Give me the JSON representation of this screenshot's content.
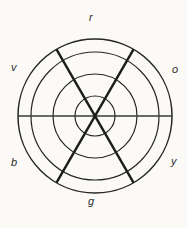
{
  "diagram": {
    "name": "color-wheel",
    "title": "",
    "background_color": "#fbfaf7",
    "stroke_color": "#262626",
    "spoke_color": "#1c1c1c",
    "label_color": "#2b2b2b",
    "center": {
      "x": 95,
      "y": 116
    },
    "ring_radii": [
      20,
      42,
      64,
      77
    ],
    "ring_count": 4,
    "spoke_count": 3,
    "spoke_angles_deg": [
      0,
      60,
      120
    ],
    "labels": [
      {
        "key": "r",
        "text": "r",
        "position": "top"
      },
      {
        "key": "o",
        "text": "o",
        "position": "upper-right"
      },
      {
        "key": "y",
        "text": "y",
        "position": "lower-right"
      },
      {
        "key": "g",
        "text": "g",
        "position": "bottom"
      },
      {
        "key": "b",
        "text": "b",
        "position": "lower-left"
      },
      {
        "key": "v",
        "text": "v",
        "position": "upper-left"
      }
    ]
  }
}
